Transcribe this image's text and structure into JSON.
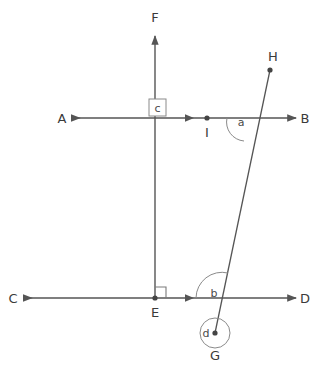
{
  "figure": {
    "type": "geometry-diagram",
    "background_color": "#ffffff",
    "stroke_color": "#555555",
    "label_color": "#3a3a3a",
    "canvas": {
      "width": 325,
      "height": 374
    },
    "points": [
      {
        "id": "A",
        "label": "A",
        "x": 62,
        "y": 118,
        "label_x": 62,
        "label_y": 123,
        "marker": "none"
      },
      {
        "id": "B",
        "label": "B",
        "x": 303,
        "y": 118,
        "label_x": 303,
        "label_y": 123,
        "marker": "none"
      },
      {
        "id": "C",
        "label": "C",
        "x": 14,
        "y": 298,
        "label_x": 14,
        "label_y": 303,
        "marker": "none"
      },
      {
        "id": "D",
        "label": "D",
        "x": 303,
        "y": 298,
        "label_x": 303,
        "label_y": 303,
        "marker": "none"
      },
      {
        "id": "E",
        "label": "E",
        "x": 155,
        "y": 298,
        "label_x": 155,
        "label_y": 317,
        "marker": "dot"
      },
      {
        "id": "F",
        "label": "F",
        "x": 155,
        "y": 30,
        "label_x": 155,
        "label_y": 22,
        "marker": "none"
      },
      {
        "id": "G",
        "label": "G",
        "x": 215,
        "y": 333,
        "label_x": 215,
        "label_y": 357,
        "marker": "dot"
      },
      {
        "id": "H",
        "label": "H",
        "x": 270,
        "y": 70,
        "label_x": 272,
        "label_y": 60,
        "marker": "dot"
      },
      {
        "id": "I",
        "label": "I",
        "x": 207,
        "y": 118,
        "label_x": 207,
        "label_y": 137,
        "marker": "dot"
      }
    ],
    "lines": [
      {
        "id": "AB",
        "name": "line-ab",
        "from": "A",
        "to": "B",
        "arrow_start": true,
        "arrow_end": true,
        "mid_arrow": true,
        "mid_arrow_x": 190,
        "mid_arrow_y": 118
      },
      {
        "id": "CD",
        "name": "line-cd",
        "from": "C",
        "to": "D",
        "arrow_start": true,
        "arrow_end": true,
        "mid_arrow": true,
        "mid_arrow_x": 190,
        "mid_arrow_y": 298
      },
      {
        "id": "EF",
        "name": "line-ef",
        "from": "E",
        "to": "F",
        "arrow_start": false,
        "arrow_end": true,
        "mid_arrow": false
      },
      {
        "id": "GH",
        "name": "line-gh",
        "from": "G",
        "to": "H",
        "arrow_start": false,
        "arrow_end": false,
        "mid_arrow": false
      }
    ],
    "angles": [
      {
        "id": "a",
        "label": "a",
        "name": "angle-a",
        "marker": "arc",
        "label_x": 241,
        "label_y": 125
      },
      {
        "id": "b",
        "label": "b",
        "name": "angle-b",
        "marker": "arc",
        "label_x": 213,
        "label_y": 296
      },
      {
        "id": "c",
        "label": "c",
        "name": "angle-c",
        "marker": "square-box",
        "label_x": 157,
        "label_y": 109
      },
      {
        "id": "d",
        "label": "d",
        "name": "angle-d",
        "marker": "full-circle",
        "label_x": 206,
        "label_y": 334
      }
    ],
    "right_angle_marks": [
      {
        "id": "E",
        "name": "right-angle-mark-e",
        "x": 155,
        "y": 298,
        "size": 11,
        "quadrant": "upper-right"
      }
    ]
  }
}
